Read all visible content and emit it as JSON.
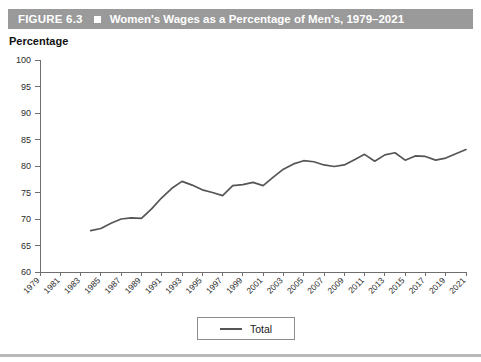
{
  "header": {
    "figure_label": "FIGURE 6.3",
    "bullet_icon": "filled-square-icon",
    "title": "Women's Wages as a Percentage of Men's, 1979–2021",
    "bar_color": "#9a9a9a",
    "text_color": "#ffffff"
  },
  "axis_caption": "Percentage",
  "legend": {
    "entries": [
      {
        "label": "Total",
        "color": "#555555"
      }
    ],
    "position": "bottom-center"
  },
  "chart_data": {
    "type": "line",
    "title": "Women's Wages as a Percentage of Men's, 1979–2021",
    "xlabel": "",
    "ylabel": "Percentage",
    "ylim": [
      60,
      100
    ],
    "xlim": [
      1979,
      2021
    ],
    "yticks": [
      60,
      65,
      70,
      75,
      80,
      85,
      90,
      95,
      100
    ],
    "xticks": [
      1979,
      1981,
      1983,
      1985,
      1987,
      1989,
      1991,
      1993,
      1995,
      1997,
      1999,
      2001,
      2003,
      2005,
      2007,
      2009,
      2011,
      2013,
      2015,
      2017,
      2019,
      2021
    ],
    "grid": false,
    "legend_position": "bottom-center",
    "series": [
      {
        "name": "Total",
        "color": "#555555",
        "x": [
          1984,
          1985,
          1986,
          1987,
          1988,
          1989,
          1990,
          1991,
          1992,
          1993,
          1994,
          1995,
          1996,
          1997,
          1998,
          1999,
          2000,
          2001,
          2002,
          2003,
          2004,
          2005,
          2006,
          2007,
          2008,
          2009,
          2010,
          2011,
          2012,
          2013,
          2014,
          2015,
          2016,
          2017,
          2018,
          2019,
          2020,
          2021
        ],
        "values": [
          67.8,
          68.2,
          69.2,
          70.0,
          70.2,
          70.1,
          71.9,
          74.0,
          75.8,
          77.1,
          76.4,
          75.5,
          75.0,
          74.4,
          76.3,
          76.5,
          76.9,
          76.3,
          77.9,
          79.4,
          80.4,
          81.0,
          80.8,
          80.2,
          79.9,
          80.2,
          81.2,
          82.2,
          80.9,
          82.1,
          82.5,
          81.1,
          81.9,
          81.8,
          81.1,
          81.5,
          82.3,
          83.1
        ]
      }
    ]
  }
}
